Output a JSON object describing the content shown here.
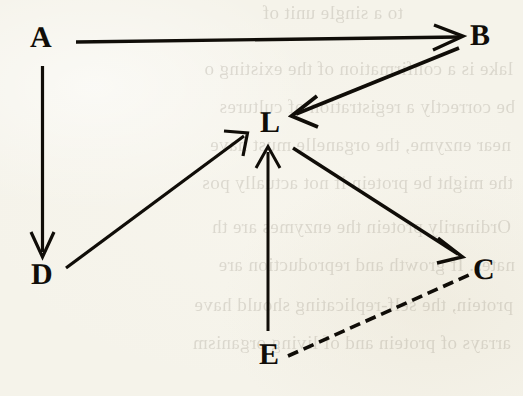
{
  "figure": {
    "background_color": "#f5f3ea",
    "ink_color": "#100d08",
    "width": 523,
    "height": 396
  },
  "nodes": [
    {
      "id": "A",
      "label": "A",
      "x": 42,
      "y": 38
    },
    {
      "id": "B",
      "label": "B",
      "x": 482,
      "y": 36
    },
    {
      "id": "L",
      "label": "L",
      "x": 270,
      "y": 123
    },
    {
      "id": "D",
      "label": "D",
      "x": 43,
      "y": 275
    },
    {
      "id": "C",
      "label": "C",
      "x": 485,
      "y": 270
    },
    {
      "id": "E",
      "label": "E",
      "x": 270,
      "y": 355
    }
  ],
  "edges": [
    {
      "id": "a-to-b",
      "from": "A",
      "to": "B",
      "style": "solid",
      "arrowhead": true
    },
    {
      "id": "a-to-d",
      "from": "A",
      "to": "D",
      "style": "solid",
      "arrowhead": true
    },
    {
      "id": "b-to-l",
      "from": "B",
      "to": "L",
      "style": "solid",
      "arrowhead": true
    },
    {
      "id": "d-to-l",
      "from": "D",
      "to": "L",
      "style": "solid",
      "arrowhead": true
    },
    {
      "id": "e-to-l",
      "from": "E",
      "to": "L",
      "style": "solid",
      "arrowhead": true
    },
    {
      "id": "l-to-c",
      "from": "L",
      "to": "C",
      "style": "solid",
      "arrowhead": true
    },
    {
      "id": "e-to-c",
      "from": "E",
      "to": "C",
      "style": "dashed",
      "arrowhead": false
    }
  ],
  "bleed_through_text": {
    "description": "faint mirrored show-through text from the reverse side of the page",
    "lines": [
      {
        "text": "to a single unit of",
        "top": 2,
        "left": 120
      },
      {
        "text": "lake is a confirmation of the existing o",
        "top": 58,
        "left": 10
      },
      {
        "text": "be correctly a registration of cultures",
        "top": 96,
        "left": 8
      },
      {
        "text": "near enzyme, the organelle must have",
        "top": 134,
        "left": 12
      },
      {
        "text": "the might be protein if not actually pos",
        "top": 172,
        "left": 10
      },
      {
        "text": "Ordinarily protein the enzymes are th",
        "top": 216,
        "left": 12
      },
      {
        "text": "nates. If growth and reproduction are",
        "top": 254,
        "left": 8
      },
      {
        "text": "protein, the self-replicating should have",
        "top": 294,
        "left": 10
      },
      {
        "text": "arrays of protein and of living organism",
        "top": 332,
        "left": 12
      }
    ]
  }
}
